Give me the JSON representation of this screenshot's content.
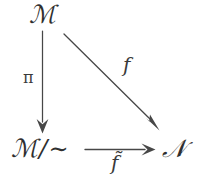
{
  "figure": {
    "kind": "commutative-diagram",
    "shape": "triangle",
    "background_color": "#ffffff",
    "ink_color": "#2f2f2f",
    "width": 198,
    "height": 187
  },
  "nodes": [
    {
      "id": "domain",
      "label": "ℳ",
      "role": "source-object",
      "position": "top-left"
    },
    {
      "id": "quotient",
      "label_main": "ℳ",
      "label_slash": "/",
      "label_relation": "∼",
      "label_full": "ℳ/∼",
      "role": "quotient-object",
      "position": "bottom-left"
    },
    {
      "id": "codomain",
      "label": "𝒩",
      "role": "target-object",
      "position": "bottom-right"
    }
  ],
  "arrows": [
    {
      "id": "projection",
      "label": "π",
      "from": "domain",
      "to": "quotient",
      "direction": "down",
      "label_side": "left"
    },
    {
      "id": "map-f",
      "label": "f",
      "from": "domain",
      "to": "codomain",
      "direction": "diagonal-down-right",
      "label_side": "above-right"
    },
    {
      "id": "induced-map",
      "label_base": "f",
      "label_accent": "̃",
      "label_full": "f̃",
      "from": "quotient",
      "to": "codomain",
      "direction": "right",
      "label_side": "below"
    }
  ]
}
